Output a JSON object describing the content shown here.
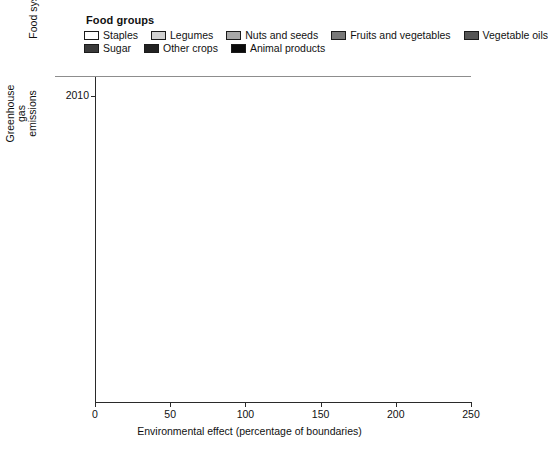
{
  "legend": {
    "title": "Food groups",
    "rows": [
      [
        {
          "label": "Staples",
          "color": "#ffffff"
        },
        {
          "label": "Legumes",
          "color": "#d2d2d2"
        },
        {
          "label": "Nuts and seeds",
          "color": "#a8a8a8"
        },
        {
          "label": "Fruits and vegetables",
          "color": "#787878"
        },
        {
          "label": "Vegetable oils",
          "color": "#555555"
        }
      ],
      [
        {
          "label": "Sugar",
          "color": "#3a3a3a"
        },
        {
          "label": "Other crops",
          "color": "#222222"
        },
        {
          "label": "Animal products",
          "color": "#0a0a0a"
        }
      ]
    ]
  },
  "axes": {
    "ylabel": "Food systems",
    "xlabel": "Environmental effect (percentage of boundaries)",
    "xticks": [
      "0",
      "50",
      "100",
      "150",
      "200",
      "250"
    ],
    "groups": [
      {
        "name": "Greenhouse gas\nemissions",
        "line1": "Greenhouse gas",
        "line2": "emissions"
      },
      {
        "name": "Cropland use",
        "line1": "Cropland use",
        "line2": ""
      },
      {
        "name": "Freshwater\nuse",
        "line1": "Freshwater",
        "line2": "use"
      },
      {
        "name": "Nitrogen\napplication",
        "line1": "Nitrogen",
        "line2": "application"
      },
      {
        "name": "Phosphorus\napplication",
        "line1": "Phosphorus",
        "line2": "application"
      }
    ],
    "yticks": [
      "2010",
      "2050"
    ]
  },
  "chart_data": {
    "type": "bar",
    "orientation": "horizontal",
    "stacked": true,
    "title": "",
    "xlabel": "Environmental effect (percentage of boundaries)",
    "ylabel": "Food systems",
    "xlim": [
      0,
      250
    ],
    "grid": false,
    "legend_position": "top",
    "series": [
      {
        "name": "Staples",
        "color": "#ffffff"
      },
      {
        "name": "Legumes",
        "color": "#d2d2d2"
      },
      {
        "name": "Nuts and seeds",
        "color": "#a8a8a8"
      },
      {
        "name": "Fruits and vegetables",
        "color": "#787878"
      },
      {
        "name": "Vegetable oils",
        "color": "#555555"
      },
      {
        "name": "Sugar",
        "color": "#3a3a3a"
      },
      {
        "name": "Other crops",
        "color": "#222222"
      },
      {
        "name": "Animal products",
        "color": "#0a0a0a"
      }
    ],
    "categories": [
      "Greenhouse gas emissions 2010",
      "Greenhouse gas emissions 2050",
      "Cropland use 2010",
      "Cropland use 2050",
      "Freshwater use 2010",
      "Freshwater use 2050",
      "Nitrogen application 2010",
      "Nitrogen application 2050",
      "Phosphorus application 2010",
      "Phosphorus application 2050"
    ],
    "bars": [
      {
        "group": "Greenhouse gas emissions",
        "year": "2010",
        "total": 101,
        "values": [
          10,
          1,
          1,
          3,
          1,
          1,
          2,
          82
        ]
      },
      {
        "group": "Greenhouse gas emissions",
        "year": "2050",
        "total": 193,
        "values": [
          19,
          2,
          2,
          6,
          2,
          2,
          4,
          156
        ]
      },
      {
        "group": "Cropland use",
        "year": "2010",
        "total": 96,
        "values": [
          38,
          4,
          9,
          8,
          6,
          3,
          6,
          22
        ]
      },
      {
        "group": "Cropland use",
        "year": "2050",
        "total": 161,
        "values": [
          66,
          8,
          16,
          14,
          11,
          5,
          11,
          30
        ]
      },
      {
        "group": "Freshwater use",
        "year": "2010",
        "total": 66,
        "values": [
          25,
          2,
          5,
          4,
          2,
          2,
          4,
          22
        ]
      },
      {
        "group": "Freshwater use",
        "year": "2050",
        "total": 119,
        "values": [
          47,
          3,
          19,
          3,
          5,
          4,
          8,
          30
        ]
      },
      {
        "group": "Nitrogen application",
        "year": "2010",
        "total": 150,
        "values": [
          56,
          2,
          16,
          6,
          3,
          2,
          4,
          61
        ]
      },
      {
        "group": "Nitrogen application",
        "year": "2050",
        "total": 226,
        "values": [
          79,
          3,
          26,
          9,
          5,
          4,
          8,
          92
        ]
      },
      {
        "group": "Phosphorus application",
        "year": "2010",
        "total": 148,
        "values": [
          44,
          2,
          18,
          8,
          4,
          3,
          5,
          64
        ]
      },
      {
        "group": "Phosphorus application",
        "year": "2050",
        "total": 228,
        "values": [
          68,
          4,
          30,
          13,
          7,
          5,
          9,
          92
        ]
      }
    ]
  }
}
